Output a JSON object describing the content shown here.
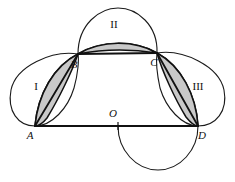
{
  "figure": {
    "background_color": "#ffffff",
    "stroke_color": "#111111",
    "shade_color": "#c9c9c9",
    "point_labels": [
      {
        "id": "A",
        "text": "A",
        "x": 30,
        "y": 139
      },
      {
        "id": "B",
        "text": "B",
        "x": 74,
        "y": 68
      },
      {
        "id": "C",
        "text": "C",
        "x": 154,
        "y": 66
      },
      {
        "id": "D",
        "text": "D",
        "x": 202,
        "y": 139
      },
      {
        "id": "O",
        "text": "O",
        "x": 113,
        "y": 117
      }
    ],
    "region_labels": [
      {
        "id": "I",
        "text": "I",
        "x": 36,
        "y": 90
      },
      {
        "id": "II",
        "text": "II",
        "x": 114,
        "y": 28
      },
      {
        "id": "III",
        "text": "III",
        "x": 198,
        "y": 90
      }
    ],
    "vertices": {
      "A": {
        "x": 35,
        "y": 126
      },
      "B": {
        "x": 78,
        "y": 54
      },
      "C": {
        "x": 157,
        "y": 53
      },
      "D": {
        "x": 198,
        "y": 126
      },
      "O": {
        "x": 118,
        "y": 126
      }
    },
    "shaded_regions": [
      {
        "id": "lune-left",
        "between": "A-B"
      },
      {
        "id": "lune-top",
        "between": "B-C"
      },
      {
        "id": "lune-right",
        "between": "C-D"
      }
    ]
  }
}
